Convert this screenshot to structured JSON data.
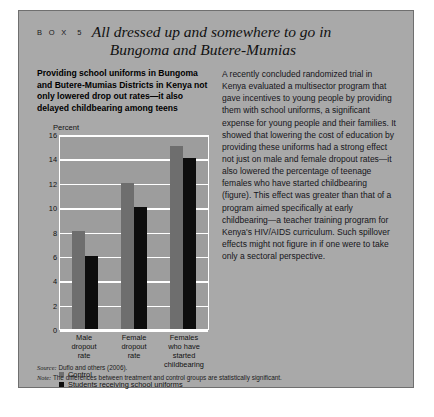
{
  "box": {
    "label": "B O X",
    "number": "5",
    "title_line1": "All dressed up and somewhere to go in",
    "title_line2": "Bungoma and Butere-Mumias"
  },
  "left_column": {
    "lede": "Providing school uniforms in Bungoma and Butere-Mumias Districts in Kenya not only lowered drop out rates—it also delayed childbearing among teens"
  },
  "right_column": {
    "body": "A recently concluded randomized trial in Kenya evaluated a multisector program that gave incentives to young people by providing them with school uniforms, a significant expense for young people and their families. It showed that lowering the cost of education by providing these uniforms had a strong effect not just on male and female dropout rates—it also lowered the percentage of teenage females who have started childbearing (figure). This effect was greater than that of a program aimed specifically at early childbearing—a teacher training program for Kenya's HIV/AIDS curriculum. Such spillover effects might not figure in if one were to take only a sectoral perspective."
  },
  "footer": {
    "source_label": "Source:",
    "source_text": "Duflo and others (2006).",
    "note_label": "Note:",
    "note_text": "The differences between treatment and control groups are statistically significant."
  },
  "colors": {
    "box_background": "#a9a9a9",
    "plot_background": "#9d9d9d",
    "gridline": "#ffffff",
    "control_bar": "#6e6e6e",
    "uniform_bar": "#0d0d0d"
  },
  "chart_data": {
    "type": "bar",
    "title": "",
    "ylabel": "Percent",
    "xlabel": "",
    "ylim": [
      0,
      16
    ],
    "yticks": [
      0,
      2,
      4,
      6,
      8,
      10,
      12,
      14,
      16
    ],
    "grid": true,
    "legend_position": "bottom",
    "categories": [
      "Male dropout rate",
      "Female dropout rate",
      "Females who have started childbearing"
    ],
    "category_lines": [
      [
        "Male",
        "dropout",
        "rate"
      ],
      [
        "Female",
        "dropout",
        "rate"
      ],
      [
        "Females",
        "who have",
        "started",
        "childbearing"
      ]
    ],
    "series": [
      {
        "name": "Control",
        "values": [
          8,
          12,
          15
        ],
        "color": "#6e6e6e"
      },
      {
        "name": "Students receiving school uniforms",
        "values": [
          6,
          10,
          14
        ],
        "color": "#0d0d0d"
      }
    ]
  }
}
